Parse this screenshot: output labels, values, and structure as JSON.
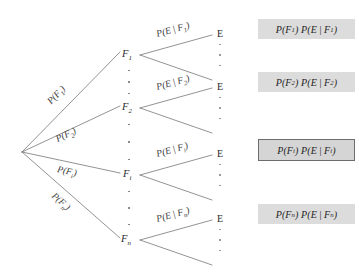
{
  "diagram": {
    "root": {
      "x": 22,
      "y": 152
    },
    "colors": {
      "line": "#6f6f6f",
      "text": "#2b2b2b",
      "box_fill": "#dcdcdc",
      "box_highlight_border": "#6d6d6d",
      "dot": "#8a8a8a"
    },
    "branches": [
      {
        "id": "branch-1",
        "node_label": "F",
        "node_sub": "1",
        "edge_label_prefix": "P(F",
        "edge_label_sub": "1",
        "edge_label_suffix": ")",
        "cond_label_prefix": "P(E",
        "cond_label_mid": "F",
        "cond_label_sub": "1",
        "cond_label_suffix": ")",
        "terminal_label": "E",
        "result_prefix": "P(F",
        "result_sub1": "1",
        "result_mid": ") P(E",
        "result_sub2": "1",
        "result_suffix": ")",
        "highlighted": false,
        "node_x": 128,
        "node_y": 55
      },
      {
        "id": "branch-2",
        "node_label": "F",
        "node_sub": "2",
        "edge_label_prefix": "P(F",
        "edge_label_sub": "2",
        "edge_label_suffix": ")",
        "cond_label_prefix": "P(E",
        "cond_label_mid": "F",
        "cond_label_sub": "2",
        "cond_label_suffix": ")",
        "terminal_label": "E",
        "result_prefix": "P(F",
        "result_sub1": "2",
        "result_mid": ") P(E",
        "result_sub2": "2",
        "result_suffix": ")",
        "highlighted": false,
        "node_x": 128,
        "node_y": 108
      },
      {
        "id": "branch-i",
        "node_label": "F",
        "node_sub": "i",
        "edge_label_prefix": "P(F",
        "edge_label_sub": "i",
        "edge_label_suffix": ")",
        "cond_label_prefix": "P(E",
        "cond_label_mid": "F",
        "cond_label_sub": "i",
        "cond_label_suffix": ")",
        "terminal_label": "E",
        "result_prefix": "P(F",
        "result_sub1": "i",
        "result_mid": ") P(E",
        "result_sub2": "i",
        "result_suffix": ")",
        "highlighted": true,
        "node_x": 128,
        "node_y": 175
      },
      {
        "id": "branch-n",
        "node_label": "F",
        "node_sub": "n",
        "edge_label_prefix": "P(F",
        "edge_label_sub": "n",
        "edge_label_suffix": ")",
        "cond_label_prefix": "P(E",
        "cond_label_mid": "F",
        "cond_label_sub": "n",
        "cond_label_suffix": ")",
        "terminal_label": "E",
        "result_prefix": "P(F",
        "result_sub1": "n",
        "result_mid": ") P(E",
        "result_sub2": "n",
        "result_suffix": ")",
        "highlighted": false,
        "node_x": 128,
        "node_y": 240
      }
    ],
    "conditional_bar": "|"
  }
}
